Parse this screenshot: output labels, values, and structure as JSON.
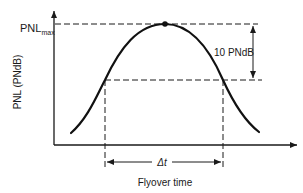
{
  "diagram": {
    "ylabel": "PNL (PNdB)",
    "xlabel": "Flyover time",
    "pnl_max_label_main": "PNL",
    "pnl_max_label_sub": "max",
    "bracket_label": "10 PNdB",
    "duration_label": "Δt",
    "colors": {
      "ink": "#1a1a1a",
      "background": "#ffffff"
    }
  }
}
